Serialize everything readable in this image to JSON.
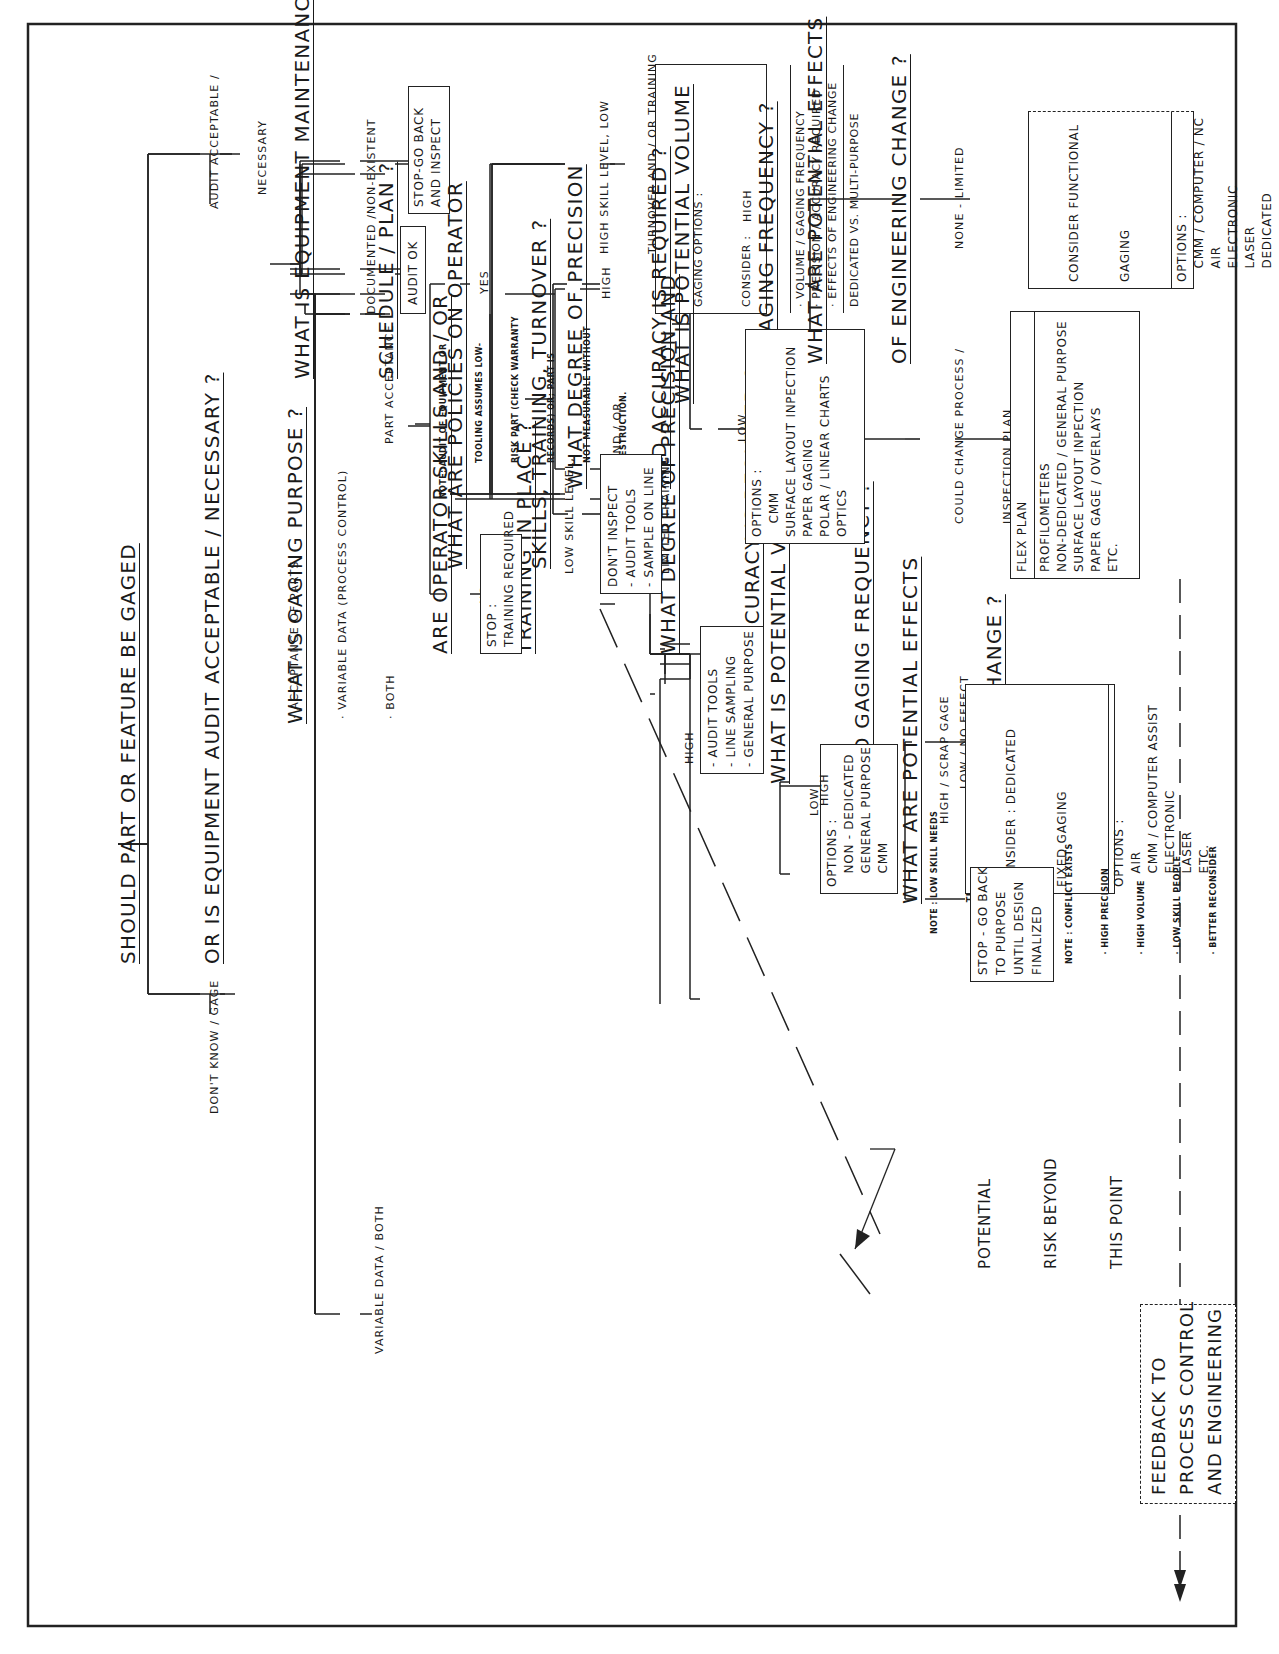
{
  "diagram": {
    "orientation": "rotated 90 degrees counter-clockwise",
    "root_question": [
      "SHOULD PART OR FEATURE BE GAGED",
      "OR IS EQUIPMENT AUDIT ACCEPTABLE / NECESSARY ?"
    ],
    "branch_audit": {
      "edge_label": [
        "AUDIT ACCEPTABLE /",
        "NECESSARY"
      ],
      "question": [
        "WHAT IS EQUIPMENT MAINTENANCE",
        "SCHEDULE / PLAN ?"
      ],
      "edge_poor": [
        "NON-EXISTENT",
        "OR POOR"
      ],
      "box_poor": [
        "STOP-GO BACK",
        "AND INSPECT"
      ],
      "edge_documented": [
        "DOCUMENTED /",
        "IN SCHEDULE"
      ],
      "box_ok": "AUDIT OK",
      "note": [
        "NOTE: AUDIT OF EQUIPMENT OR",
        "TOOLING ASSUMES LOW-",
        "RISK PART (CHECK WARRANTY",
        "RECORDS) OR; PART IS",
        "NOT MEASURABLE WITHOUT",
        "DESTRUCTION."
      ]
    },
    "branch_gage": {
      "edge_label": "DON'T KNOW / GAGE",
      "question": [
        "WHAT IS GAGING PURPOSE ?"
      ],
      "purposes": [
        "· ACCEPTANCE OF PARTS",
        "· VARIABLE DATA (PROCESS CONTROL)",
        "· BOTH"
      ],
      "part_acceptance": {
        "edge_label": "PART ACCEPTANCE",
        "question": [
          "WHAT ARE POLICIES ON OPERATOR",
          "SKILLS, TRAINING, TURNOVER ?"
        ],
        "high_skill": {
          "edge_label": [
            "HIGH SKILL LEVEL, LOW",
            "TURNOVER AND / OR TRAINING",
            "PLAN"
          ],
          "box_header": [
            "GAGING OPTIONS :",
            "CONSIDER :"
          ],
          "box_items": [
            "· VOLUME / GAGING FREQUENCY",
            "· PRECISION / ACCURACY REQUIRED",
            "· EFFECTS OF ENGINEERING CHANGE"
          ],
          "box_footer": "DEDICATED VS. MULTI-PURPOSE"
        },
        "low_skill": {
          "edge_label": [
            "LOW SKILL LEVEL,",
            "HIGH TURNOVER AND / OR",
            "LIMITED TRAINING"
          ],
          "question": [
            "WHAT DEGREE OF PRECISION AND",
            "ACCURACY IS REQUIRED ?"
          ],
          "low": {
            "edge_label": "LOW",
            "box": [
              "- AUDIT TOOLS",
              "- LINE SAMPLING",
              "- GENERAL PURPOSE"
            ]
          },
          "high": {
            "edge_label": "HIGH",
            "question": [
              "WHAT IS POTENTIAL VOLUME",
              "AND GAGING FREQUENCY ?"
            ],
            "low": {
              "edge_label": "LOW",
              "box": [
                "OPTIONS :",
                "   NON - DEDICATED",
                "   GENERAL PURPOSE",
                "   CMM"
              ],
              "note": [
                "NOTE : LOW SKILL NEEDS",
                "          TRAINING"
              ]
            },
            "high": {
              "edge_label": "HIGH",
              "question": [
                "WHAT ARE POTENTIAL EFFECTS",
                "OF ENGINEERING CHANGE ?"
              ],
              "high_scrap": {
                "edge_label": "HIGH / SCRAP GAGE",
                "box": [
                  "STOP - GO BACK",
                  "TO PURPOSE",
                  "UNTIL DESIGN",
                  "FINALIZED"
                ]
              },
              "low_no_effect": {
                "edge_label": "LOW / NO EFFECT",
                "box_header": [
                  "CONSIDER : DEDICATED",
                  "FIXED GAGING"
                ],
                "box_items": [
                  "OPTIONS :",
                  "   AIR",
                  "   CMM / COMPUTER ASSIST",
                  "   ELECTRONIC",
                  "   LASER",
                  "   ETC."
                ]
              },
              "note": [
                "NOTE : CONFLICT EXISTS",
                "   · HIGH PRECISION",
                "   · HIGH VOLUME",
                "   · LOW SKILL PEOPLE",
                "   · BETTER RECONSIDER"
              ]
            }
          }
        }
      },
      "variable_data": {
        "edge_label": "VARIABLE DATA / BOTH",
        "question": [
          "ARE OPERATOR SKILLS AND / OR",
          "TRAINING IN PLACE ?"
        ],
        "no": {
          "edge_label": "NO",
          "box": [
            "STOP :",
            "TRAINING REQUIRED"
          ]
        },
        "yes": {
          "edge_label": "YES",
          "question": [
            "WHAT DEGREE OF PRECISION",
            "AND ACCURACY IS REQUIRED ?"
          ],
          "low": {
            "edge_label": "LOW",
            "box": [
              "DON'T INSPECT",
              "- AUDIT TOOLS",
              "- SAMPLE ON LINE"
            ]
          },
          "high": {
            "edge_label": "HIGH",
            "question": [
              "WHAT IS POTENTIAL VOLUME",
              "AND GAGING FREQUENCY ?"
            ],
            "low": {
              "edge_label": "LOW",
              "box": [
                "OPTIONS :",
                "   CMM",
                "SURFACE LAYOUT INPECTION",
                "PAPER GAGING",
                "POLAR / LINEAR CHARTS",
                "OPTICS"
              ]
            },
            "high": {
              "edge_label": "HIGH",
              "question": [
                "WHAT ARE POTENTIAL EFFECTS",
                "OF ENGINEERING CHANGE ?"
              ],
              "could_change": {
                "edge_label": [
                  "COULD CHANGE PROCESS /",
                  "INSPECTION PLAN"
                ],
                "box_header": "FLEX PLAN",
                "box_items": [
                  "PROFILOMETERS",
                  "NON-DEDICATED / GENERAL PURPOSE",
                  "SURFACE LAYOUT INPECTION",
                  "PAPER GAGE / OVERLAYS",
                  "ETC."
                ]
              },
              "none_limited": {
                "edge_label": "NONE - LIMITED",
                "box_header": [
                  "CONSIDER FUNCTIONAL",
                  "GAGING"
                ],
                "box_items": [
                  "OPTIONS :",
                  "   CMM / COMPUTER / NC",
                  "   AIR",
                  "   ELECTRONIC",
                  "   LASER",
                  "   DEDICATED"
                ]
              }
            }
          }
        }
      }
    },
    "risk_label": [
      "POTENTIAL",
      "RISK BEYOND",
      "THIS POINT"
    ],
    "feedback_box": [
      "FEEDBACK TO",
      "PROCESS CONTROL",
      "AND ENGINEERING"
    ],
    "colors": {
      "line": "#222222",
      "background": "#ffffff"
    }
  }
}
